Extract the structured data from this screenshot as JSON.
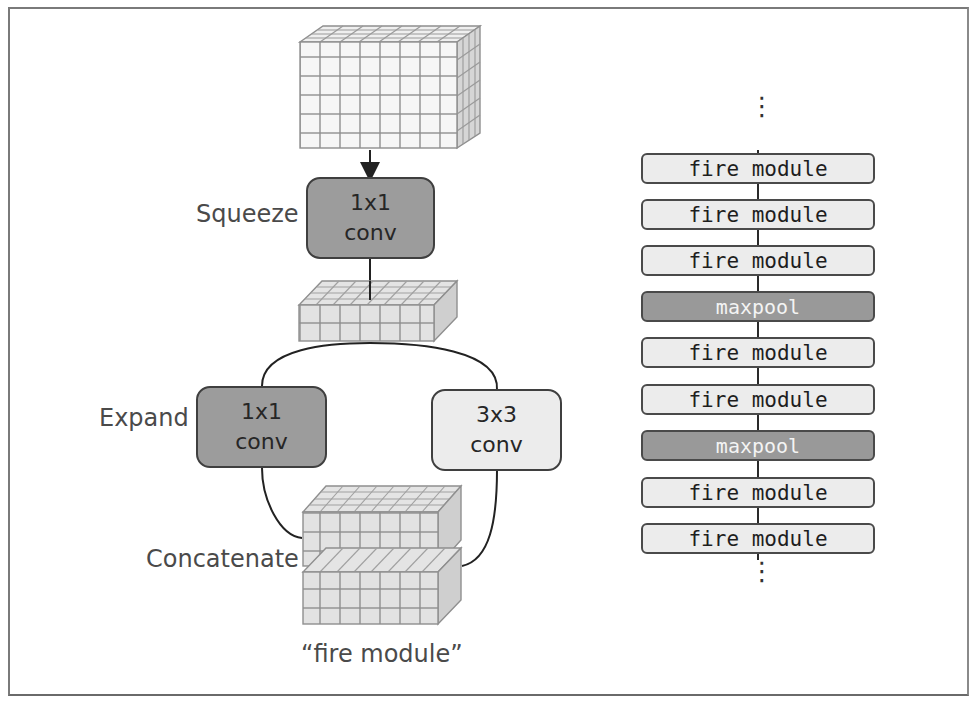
{
  "left_diagram": {
    "caption": "“fire module”",
    "squeeze": {
      "label": "Squeeze",
      "box_line1": "1x1",
      "box_line2": "conv",
      "color": "#9c9c9c"
    },
    "expand": {
      "label": "Expand",
      "left_box": {
        "line1": "1x1",
        "line2": "conv",
        "color": "#9c9c9c"
      },
      "right_box": {
        "line1": "3x3",
        "line2": "conv",
        "color": "#ececec"
      }
    },
    "concatenate": {
      "label": "Concatenate"
    },
    "input_tensor": {
      "grid_cols": 8,
      "grid_rows": 6,
      "depth": 4
    },
    "squeezed_tensor": {
      "grid_cols": 8,
      "grid_rows": 2,
      "depth": 4
    },
    "output_tensor": {
      "blocks": 2,
      "grid_cols": 8,
      "grid_rows": 3,
      "depth": 4
    }
  },
  "right_diagram": {
    "top_ellipsis": "⋮",
    "bottom_ellipsis": "⋮",
    "layers": [
      {
        "label": "fire module",
        "type": "fire"
      },
      {
        "label": "fire module",
        "type": "fire"
      },
      {
        "label": "fire module",
        "type": "fire"
      },
      {
        "label": "maxpool",
        "type": "pool"
      },
      {
        "label": "fire module",
        "type": "fire"
      },
      {
        "label": "fire module",
        "type": "fire"
      },
      {
        "label": "maxpool",
        "type": "pool"
      },
      {
        "label": "fire module",
        "type": "fire"
      },
      {
        "label": "fire module",
        "type": "fire"
      }
    ],
    "colors": {
      "fire_fill": "#ececec",
      "pool_fill": "#999999",
      "border": "#4a4a4a"
    }
  }
}
